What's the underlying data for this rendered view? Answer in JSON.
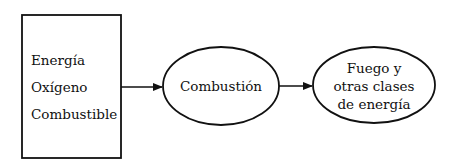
{
  "diagram": {
    "inputs_box": {
      "lines": [
        "Energía",
        "Oxígeno",
        "Combustible"
      ]
    },
    "process_node": {
      "label": "Combustión"
    },
    "output_node": {
      "lines": [
        "Fuego y",
        "otras clases",
        "de energía"
      ]
    },
    "edges": [
      {
        "from": "inputs_box",
        "to": "process_node"
      },
      {
        "from": "process_node",
        "to": "output_node"
      }
    ],
    "colors": {
      "stroke": "#111111",
      "background": "#ffffff"
    }
  }
}
